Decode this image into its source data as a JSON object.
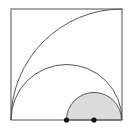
{
  "diagram": {
    "type": "geometry",
    "colors": {
      "stroke": "#555555",
      "shade": "#dcdcdc",
      "point": "#111111",
      "background": "#ffffff"
    },
    "square": {
      "x": 11,
      "y": 9,
      "side": 111
    },
    "quarter_arc": {
      "cx": 122,
      "cy": 120,
      "r": 111
    },
    "large_semicircle": {
      "cx": 66.5,
      "cy": 120,
      "r": 55.5
    },
    "small_semicircle": {
      "cx": 94,
      "cy": 120,
      "r": 27.5,
      "shaded": true
    },
    "points": [
      {
        "name": "center-of-large-semicircle",
        "x": 66.5,
        "y": 120
      },
      {
        "name": "center-of-small-semicircle",
        "x": 94,
        "y": 120
      }
    ]
  }
}
